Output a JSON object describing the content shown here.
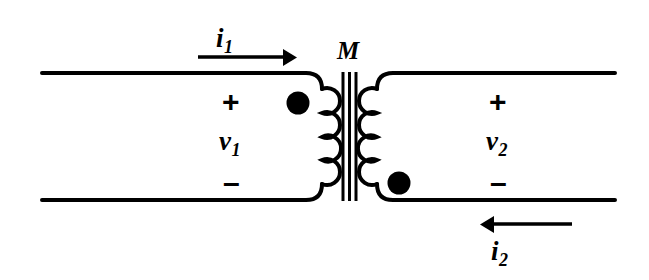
{
  "diagram": {
    "type": "circuit-schematic",
    "stroke_color": "#000000",
    "background_color": "#ffffff",
    "labels": {
      "mutual_inductance": "M",
      "current_1": "i",
      "current_1_sub": "1",
      "current_2": "i",
      "current_2_sub": "2",
      "voltage_1": "v",
      "voltage_1_sub": "1",
      "voltage_2": "v",
      "voltage_2_sub": "2",
      "plus_1": "+",
      "minus_1": "–",
      "plus_2": "+",
      "minus_2": "–"
    },
    "primary": {
      "name": "primary-winding",
      "coil_turns": 4,
      "dot_position": "top",
      "current_direction": "right",
      "polarity_top": "+",
      "polarity_bottom": "–"
    },
    "secondary": {
      "name": "secondary-winding",
      "coil_turns": 4,
      "dot_position": "bottom",
      "current_direction": "left",
      "polarity_top": "+",
      "polarity_bottom": "–"
    },
    "core": {
      "name": "iron-core",
      "bar_count": 3
    }
  }
}
